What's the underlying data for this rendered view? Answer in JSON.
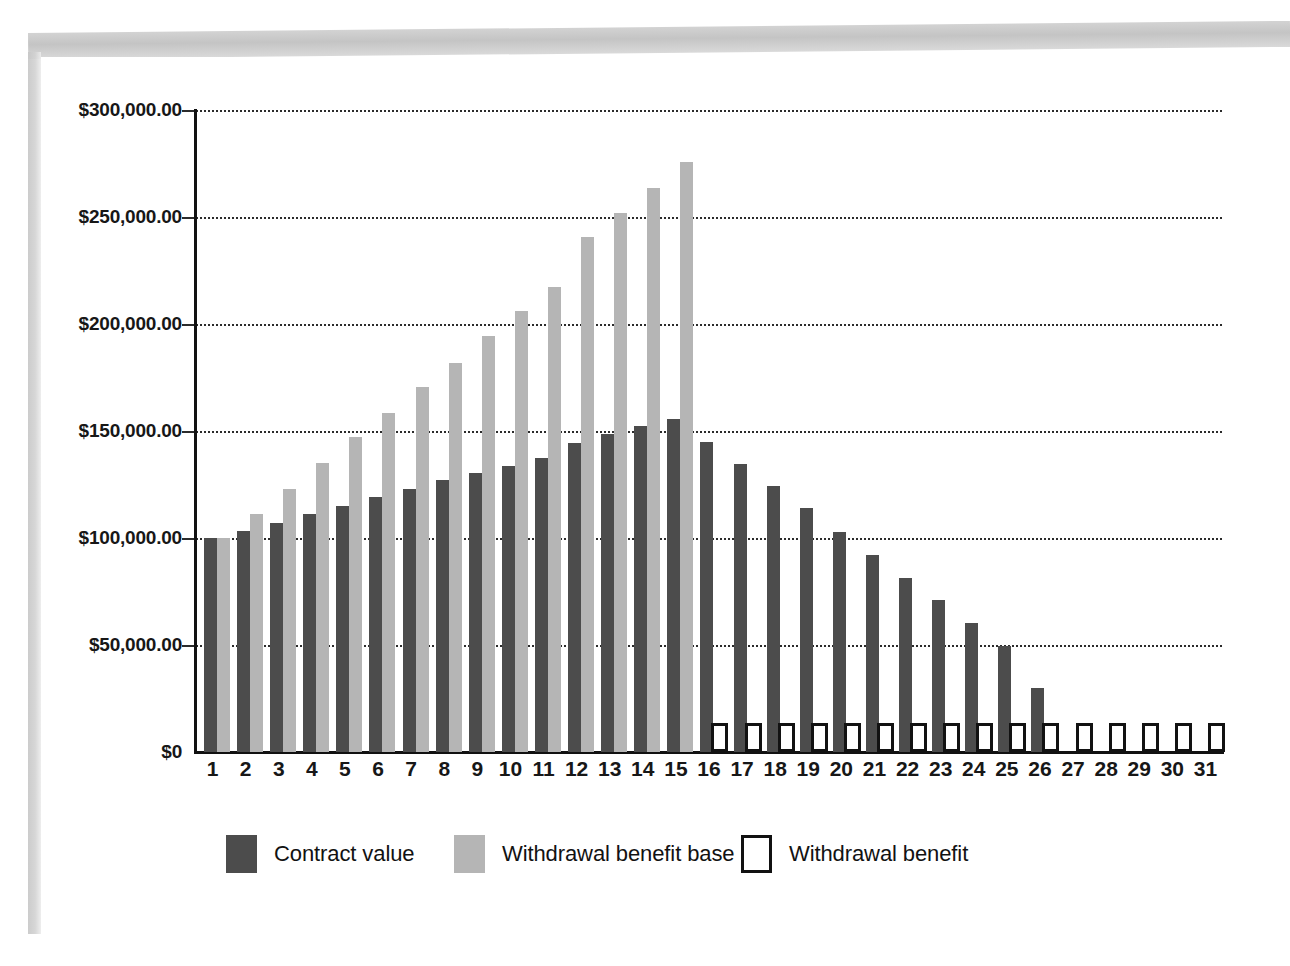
{
  "chart_data": {
    "type": "bar",
    "title": "",
    "xlabel": "",
    "ylabel": "",
    "ylim": [
      0,
      300000
    ],
    "grid": true,
    "legend_position": "bottom",
    "categories": [
      "1",
      "2",
      "3",
      "4",
      "5",
      "6",
      "7",
      "8",
      "9",
      "10",
      "11",
      "12",
      "13",
      "14",
      "15",
      "16",
      "17",
      "18",
      "19",
      "20",
      "21",
      "22",
      "23",
      "24",
      "25",
      "26",
      "27",
      "28",
      "29",
      "30",
      "31"
    ],
    "y_ticks": [
      0,
      50000,
      100000,
      150000,
      200000,
      250000,
      300000
    ],
    "y_tick_labels": [
      "$0",
      "$50,000.00",
      "$100,000.00",
      "$150,000.00",
      "$200,000.00",
      "$250,000.00",
      "$300,000.00"
    ],
    "series": [
      {
        "name": "Contract value",
        "color": "#4c4c4c",
        "values": [
          100000,
          103500,
          107000,
          111000,
          115000,
          119000,
          123000,
          127000,
          130500,
          133500,
          137500,
          144500,
          148500,
          152500,
          155500,
          145000,
          134500,
          124500,
          114000,
          103000,
          92000,
          81500,
          71000,
          60500,
          49500,
          30000,
          0,
          0,
          0,
          0,
          0
        ]
      },
      {
        "name": "Withdrawal benefit base",
        "color": "#b5b5b5",
        "values": [
          100000,
          111000,
          123000,
          135000,
          147000,
          158500,
          170500,
          182000,
          194500,
          206000,
          217500,
          240500,
          252000,
          263500,
          275500,
          0,
          0,
          0,
          0,
          0,
          0,
          0,
          0,
          0,
          0,
          0,
          0,
          0,
          0,
          0,
          0
        ]
      },
      {
        "name": "Withdrawal benefit",
        "color": "#ffffff",
        "outline": "#121212",
        "values": [
          0,
          0,
          0,
          0,
          0,
          0,
          0,
          0,
          0,
          0,
          0,
          0,
          0,
          0,
          0,
          13750,
          13750,
          13750,
          13750,
          13750,
          13750,
          13750,
          13750,
          13750,
          13750,
          13750,
          13750,
          13750,
          13750,
          13750,
          13750
        ]
      }
    ]
  },
  "legend": {
    "items": [
      {
        "label": "Contract value"
      },
      {
        "label": "Withdrawal benefit base"
      },
      {
        "label": "Withdrawal benefit"
      }
    ]
  },
  "colors": {
    "contract_value": "#4c4c4c",
    "withdrawal_benefit_base": "#b5b5b5",
    "withdrawal_benefit_outline": "#121212",
    "axis": "#111111",
    "gridline": "#2b2b2b",
    "page_background": "#ffffff"
  }
}
